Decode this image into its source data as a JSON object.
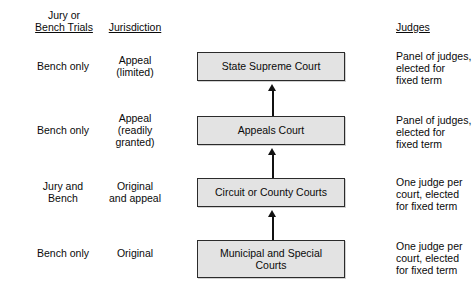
{
  "headers": {
    "col_a_line1": "Jury or",
    "col_a_line2": "Bench Trials",
    "col_b": "Jurisdiction",
    "col_d": "Judges"
  },
  "rows": [
    {
      "trials": "Bench only",
      "jurisdiction_line1": "Appeal",
      "jurisdiction_line2": "(limited)",
      "jurisdiction_line3": "",
      "court_line1": "State Supreme Court",
      "court_line2": "",
      "judges_line1": "Panel of judges,",
      "judges_line2": "elected for",
      "judges_line3": "fixed term"
    },
    {
      "trials": "Bench only",
      "jurisdiction_line1": "Appeal",
      "jurisdiction_line2": "(readily",
      "jurisdiction_line3": "granted)",
      "court_line1": "Appeals Court",
      "court_line2": "",
      "judges_line1": "Panel of judges,",
      "judges_line2": "elected for",
      "judges_line3": "fixed term"
    },
    {
      "trials_line1": "Jury and",
      "trials_line2": "Bench",
      "jurisdiction_line1": "Original",
      "jurisdiction_line2": "and appeal",
      "jurisdiction_line3": "",
      "court_line1": "Circuit or County Courts",
      "court_line2": "",
      "judges_line1": "One judge per",
      "judges_line2": "court, elected",
      "judges_line3": "for fixed term"
    },
    {
      "trials": "Bench only",
      "jurisdiction_line1": "Original",
      "jurisdiction_line2": "",
      "jurisdiction_line3": "",
      "court_line1": "Municipal and Special",
      "court_line2": "Courts",
      "judges_line1": "One judge per",
      "judges_line2": "court, elected",
      "judges_line3": "for fixed term"
    }
  ],
  "colors": {
    "box_fill": "#e3e3e3",
    "box_border": "#2b2b2b",
    "arrow": "#111111",
    "text": "#0a0a0a",
    "background": "#ffffff"
  }
}
